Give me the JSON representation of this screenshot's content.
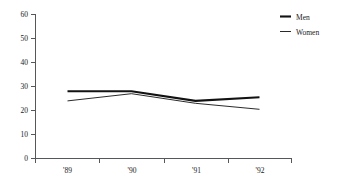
{
  "chart_data": {
    "type": "line",
    "title": "",
    "subtitle": "",
    "xlabel": "",
    "ylabel": "",
    "categories": [
      "'89",
      "'90",
      "'91",
      "'92"
    ],
    "series": [
      {
        "name": "Men",
        "values": [
          28,
          28,
          24,
          25.5
        ]
      },
      {
        "name": "Women",
        "values": [
          24,
          27,
          23,
          20.5
        ]
      }
    ],
    "ylim": [
      0,
      60
    ],
    "yticks": [
      0,
      10,
      20,
      30,
      40,
      50,
      60
    ],
    "ytick_labels": [
      "0",
      "10",
      "20",
      "30",
      "40",
      "50",
      "60"
    ],
    "xtick_labels": [
      "'89",
      "'90",
      "'91",
      "'92"
    ],
    "grid": false,
    "legend_position": "top-right",
    "colors": {
      "men": "#121212",
      "women": "#121212",
      "axis": "#55585a",
      "text": "#1a1a1a",
      "background": "#ffffff"
    }
  },
  "legend": {
    "items": [
      {
        "label": "Men",
        "style": "thick-line"
      },
      {
        "label": "Women",
        "style": "thin-line"
      }
    ]
  },
  "axes": {
    "y": {
      "labels": [
        "60",
        "50",
        "40",
        "30",
        "20",
        "10",
        "0"
      ]
    },
    "x": {
      "labels": [
        "'89",
        "'90",
        "'91",
        "'92"
      ]
    }
  }
}
